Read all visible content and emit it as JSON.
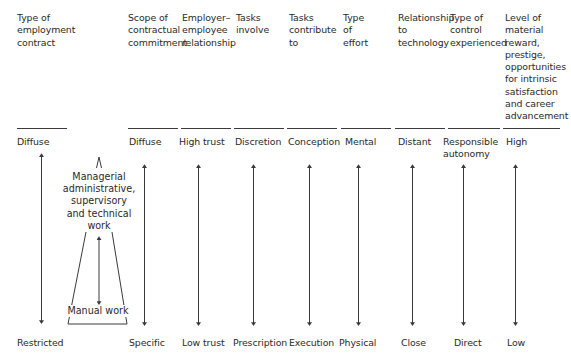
{
  "columns": [
    {
      "header": "Type of\nemployment\ncontract",
      "top": "Diffuse",
      "bottom": "Restricted"
    },
    {
      "header": "Scope of\ncontractual\ncommitment",
      "top": "Diffuse",
      "bottom": "Specific"
    },
    {
      "header": "Employer–\nemployee\nrelationship",
      "top": "High trust",
      "bottom": "Low trust"
    },
    {
      "header": "Tasks\ninvolve",
      "top": "Discretion",
      "bottom": "Prescription"
    },
    {
      "header": "Tasks\ncontribute\nto",
      "top": "Conception",
      "bottom": "Execution"
    },
    {
      "header": "Type\nof\neffort",
      "top": "Mental",
      "bottom": "Physical"
    },
    {
      "header": "Relationship\nto\ntechnology",
      "top": "Distant",
      "bottom": "Close"
    },
    {
      "header": "Type of\ncontrol\nexperienced",
      "top": "Responsible\nautonomy",
      "bottom": "Direct"
    },
    {
      "header": "Level of\nmaterial\nreward,\nprestige,\nopportunities\nfor intrinsic\nsatisfaction\nand career\nadvancement",
      "top": "High",
      "bottom": "Low"
    }
  ],
  "work_types": {
    "upper": "Managerial\nadministrative,\nsupervisory\nand technical\nwork",
    "lower": "Manual work"
  },
  "colors": {
    "text": "#2a2a2a",
    "lines": "#3a3a3a",
    "background": "#ffffff"
  }
}
